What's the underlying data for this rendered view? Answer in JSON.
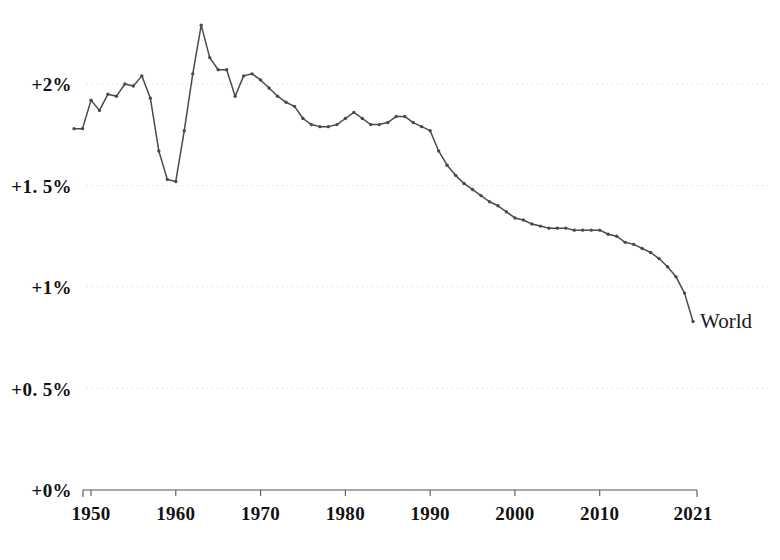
{
  "chart_data": {
    "type": "line",
    "title": "",
    "subtitle": "",
    "xlabel": "",
    "ylabel": "",
    "xlim": [
      1948,
      2021
    ],
    "ylim": [
      0,
      2.5
    ],
    "grid": true,
    "grid_style": "dotted-horizontal",
    "legend_position": "line-end-label",
    "series": [
      {
        "name": "World",
        "color": "#4a4a4a",
        "marker": "dot",
        "x": [
          1948,
          1949,
          1950,
          1951,
          1952,
          1953,
          1954,
          1955,
          1956,
          1957,
          1958,
          1959,
          1960,
          1961,
          1962,
          1963,
          1964,
          1965,
          1966,
          1967,
          1968,
          1969,
          1970,
          1971,
          1972,
          1973,
          1974,
          1975,
          1976,
          1977,
          1978,
          1979,
          1980,
          1981,
          1982,
          1983,
          1984,
          1985,
          1986,
          1987,
          1988,
          1989,
          1990,
          1991,
          1992,
          1993,
          1994,
          1995,
          1996,
          1997,
          1998,
          1999,
          2000,
          2001,
          2002,
          2003,
          2004,
          2005,
          2006,
          2007,
          2008,
          2009,
          2010,
          2011,
          2012,
          2013,
          2014,
          2015,
          2016,
          2017,
          2018,
          2019,
          2020,
          2021
        ],
        "y": [
          1.78,
          1.78,
          1.92,
          1.87,
          1.95,
          1.94,
          2.0,
          1.99,
          2.04,
          1.93,
          1.67,
          1.53,
          1.52,
          1.77,
          2.05,
          2.29,
          2.13,
          2.07,
          2.07,
          1.94,
          2.04,
          2.05,
          2.02,
          1.98,
          1.94,
          1.91,
          1.89,
          1.83,
          1.8,
          1.79,
          1.79,
          1.8,
          1.83,
          1.86,
          1.83,
          1.8,
          1.8,
          1.81,
          1.84,
          1.84,
          1.81,
          1.79,
          1.77,
          1.67,
          1.6,
          1.55,
          1.51,
          1.48,
          1.45,
          1.42,
          1.4,
          1.37,
          1.34,
          1.33,
          1.31,
          1.3,
          1.29,
          1.29,
          1.29,
          1.28,
          1.28,
          1.28,
          1.28,
          1.26,
          1.25,
          1.22,
          1.21,
          1.19,
          1.17,
          1.14,
          1.1,
          1.05,
          0.97,
          0.83
        ]
      }
    ],
    "y_ticks": [
      {
        "value": 0,
        "label": "+0%"
      },
      {
        "value": 0.5,
        "label": "+0. 5%"
      },
      {
        "value": 1.0,
        "label": "+1%"
      },
      {
        "value": 1.5,
        "label": "+1. 5%"
      },
      {
        "value": 2.0,
        "label": "+2%"
      }
    ],
    "x_ticks": [
      {
        "value": 1950,
        "label": "1950"
      },
      {
        "value": 1960,
        "label": "1960"
      },
      {
        "value": 1970,
        "label": "1970"
      },
      {
        "value": 1980,
        "label": "1980"
      },
      {
        "value": 1990,
        "label": "1990"
      },
      {
        "value": 2000,
        "label": "2000"
      },
      {
        "value": 2010,
        "label": "2010"
      },
      {
        "value": 2021,
        "label": "2021"
      }
    ],
    "annotations": [
      {
        "name": "world-series-label",
        "text": "World",
        "x": 2021,
        "y": 0.83
      }
    ]
  },
  "style": {
    "line_color": "#4a4a4a",
    "axis_color": "#555555",
    "grid_color": "#d9d9d9",
    "text_color": "#111111",
    "background": "#ffffff"
  }
}
